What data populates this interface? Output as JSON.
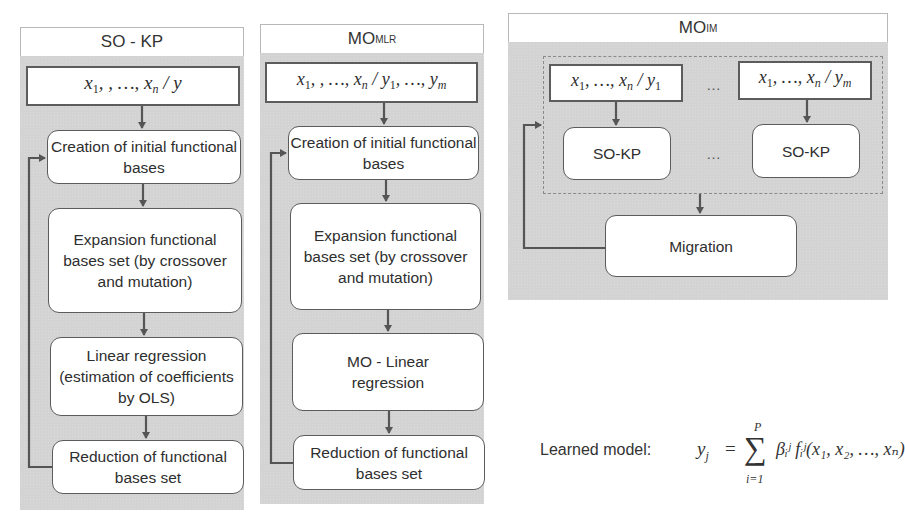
{
  "panels": {
    "so_kp": {
      "title": "SO - KP",
      "input": {
        "vars": "x",
        "first_sub": "1",
        "seq": ", , …, ",
        "last_sub": "n",
        "sep": " / ",
        "target": "y"
      },
      "steps": [
        "Creation of initial functional bases",
        "Expansion functional bases set (by crossover and mutation)",
        "Linear regression (estimation of coefficients by OLS)",
        "Reduction of functional bases set"
      ]
    },
    "mo_mlr": {
      "title_main": "MO",
      "title_sub": "MLR",
      "input": {
        "text": "x₁, , …, xₙ / y₁, …, yₘ"
      },
      "steps": [
        "Creation of initial functional bases",
        "Expansion functional bases set (by crossover and mutation)",
        "MO - Linear regression",
        "Reduction of functional bases set"
      ]
    },
    "mo_im": {
      "title_main": "MO",
      "title_sub": "IM",
      "inputs": [
        "x₁, …, xₙ / y₁",
        "x₁, …, xₙ / yₘ"
      ],
      "sub_models": [
        "SO-KP",
        "SO-KP"
      ],
      "ellipsis": "…",
      "migration": "Migration"
    }
  },
  "learned_model": {
    "label": "Learned model:",
    "lhs": "y",
    "lhs_sub": "j",
    "equals": "=",
    "sum_symbol": "∑",
    "sum_upper": "P",
    "sum_lower": "i=1",
    "term": "βᵢʲ fᵢʲ(x₁, x₂, …, xₙ)"
  },
  "colors": {
    "panel_bg": "#d3d3d3",
    "box_bg": "#ffffff",
    "arrow": "#555555"
  }
}
